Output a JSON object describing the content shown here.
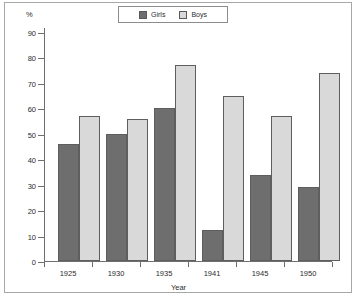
{
  "chart_data": {
    "type": "bar",
    "title": "",
    "xlabel": "Year",
    "ylabel": "%",
    "unit": "%",
    "categories": [
      "1925",
      "1930",
      "1935",
      "1941",
      "1945",
      "1950"
    ],
    "series": [
      {
        "name": "Girls",
        "color": "#6e6e6e",
        "values": [
          46,
          50,
          60,
          12,
          34,
          29
        ]
      },
      {
        "name": "Boys",
        "color": "#d9d9d9",
        "values": [
          57,
          56,
          77,
          65,
          57,
          74
        ]
      }
    ],
    "ylim": [
      0,
      90
    ],
    "ytick_step": 10,
    "yticks": [
      "0",
      "10",
      "20",
      "30",
      "40",
      "50",
      "60",
      "70",
      "80",
      "90"
    ],
    "grid": false,
    "legend_position": "top-center",
    "legend": [
      "Girls",
      "Boys"
    ]
  },
  "colors": {
    "girls": "#6e6e6e",
    "boys": "#d9d9d9",
    "axis": "#6f6f6f",
    "bar_outline": "#5e5e5e",
    "frame": "#a7a7a7",
    "text": "#2b2b2b",
    "background": "#ffffff"
  }
}
